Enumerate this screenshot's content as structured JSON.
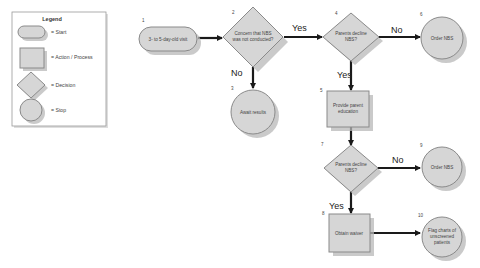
{
  "legend": {
    "title": "Legend",
    "items": [
      {
        "shape": "pill",
        "label": "= Start"
      },
      {
        "shape": "rectangle",
        "label": "= Action / Process"
      },
      {
        "shape": "diamond",
        "label": "= Decision"
      },
      {
        "shape": "circle",
        "label": "= Stop"
      }
    ]
  },
  "nodes": {
    "n1": {
      "number": "1",
      "type": "start",
      "lines": [
        "3- to 5-day-old visit"
      ]
    },
    "n2": {
      "number": "2",
      "type": "decision",
      "lines": [
        "Concern that NBS",
        "was not conducted?"
      ]
    },
    "n3": {
      "number": "3",
      "type": "stop",
      "lines": [
        "Await results"
      ]
    },
    "n4": {
      "number": "4",
      "type": "decision",
      "lines": [
        "Parents decline",
        "NBS?"
      ]
    },
    "n5": {
      "number": "5",
      "type": "action",
      "lines": [
        "Provide parent",
        "education"
      ]
    },
    "n6": {
      "number": "6",
      "type": "stop",
      "lines": [
        "Order NBS"
      ]
    },
    "n7": {
      "number": "7",
      "type": "decision",
      "lines": [
        "Parents decline",
        "NBS?"
      ]
    },
    "n8": {
      "number": "8",
      "type": "action",
      "lines": [
        "Obtain waiver"
      ]
    },
    "n9": {
      "number": "9",
      "type": "stop",
      "lines": [
        "Order NBS"
      ]
    },
    "n10": {
      "number": "10",
      "type": "stop",
      "lines": [
        "Flag charts of",
        "unscreened",
        "patients"
      ]
    }
  },
  "edges": {
    "e1_2": {
      "label": ""
    },
    "e2_3": {
      "label": "No"
    },
    "e2_4": {
      "label": "Yes"
    },
    "e4_6": {
      "label": "No"
    },
    "e4_5": {
      "label": "Yes"
    },
    "e5_7": {
      "label": ""
    },
    "e7_9": {
      "label": "No"
    },
    "e7_8": {
      "label": "Yes"
    },
    "e8_10": {
      "label": ""
    }
  },
  "colors": {
    "shape_fill": "#d6d6d6",
    "shape_stroke": "#8a8a8a",
    "shadow": "#b8b8b8",
    "edge": "#1a1a1a",
    "background": "#ffffff"
  }
}
